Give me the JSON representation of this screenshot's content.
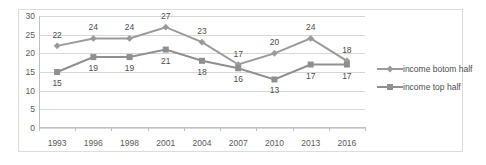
{
  "chart_data": {
    "type": "line",
    "title": "",
    "xlabel": "",
    "ylabel": "",
    "ylim": [
      0,
      30
    ],
    "ytick_step": 5,
    "yticks": [
      "0",
      "5",
      "10",
      "15",
      "20",
      "25",
      "30"
    ],
    "grid": true,
    "legend_position": "right",
    "categories": [
      "1993",
      "1996",
      "1998",
      "2001",
      "2004",
      "2007",
      "2010",
      "2013",
      "2016"
    ],
    "series": [
      {
        "name": "income botom half",
        "marker": "diamond",
        "color": "#9a9a9a",
        "label_position": "above",
        "values": [
          22,
          24,
          24,
          27,
          23,
          17,
          20,
          24,
          18
        ]
      },
      {
        "name": "income top half",
        "marker": "square",
        "color": "#8f8f8f",
        "label_position": "below",
        "values": [
          15,
          19,
          19,
          21,
          18,
          16,
          13,
          17,
          17
        ]
      }
    ]
  },
  "colors": {
    "series_gray": "#9a9a9a",
    "gridline": "#d6d6d6",
    "axis": "#bfbfbf",
    "border": "#dcdcdc",
    "text": "#595959",
    "background": "#ffffff"
  }
}
